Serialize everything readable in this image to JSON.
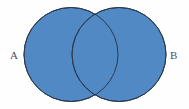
{
  "figure": {
    "type": "venn-diagram",
    "background_color": "#fefefe",
    "sets": [
      {
        "id": "A",
        "label": "A",
        "label_position": "left",
        "fill_color": "#5189c4",
        "stroke_color": "#2b3a4d",
        "center_x": 71,
        "center_y": 54.5,
        "radius": 47
      },
      {
        "id": "B",
        "label": "B",
        "label_position": "right",
        "fill_color": "#5189c4",
        "stroke_color": "#2b3a4d",
        "center_x": 119,
        "center_y": 54.5,
        "radius": 47
      }
    ],
    "intersection": {
      "label": "",
      "fill_color": "#5189c4",
      "shaded": true,
      "top_point_x": 96,
      "top_point_y": 12,
      "bottom_point_x": 96,
      "bottom_point_y": 97
    },
    "stroke_width": 1,
    "label_color": "#45515e"
  }
}
